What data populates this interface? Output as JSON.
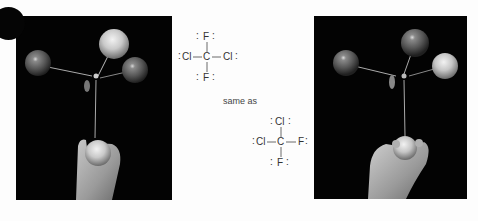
{
  "figure": {
    "left_photo": {
      "description": "molecular ball-and-stick model held in hand",
      "balls": [
        {
          "role": "left",
          "shade": "dark"
        },
        {
          "role": "top",
          "shade": "light"
        },
        {
          "role": "right",
          "shade": "dark"
        },
        {
          "role": "bottom-in-hand",
          "shade": "light"
        }
      ]
    },
    "right_photo": {
      "description": "rotated molecular ball-and-stick model held in hand",
      "balls": [
        {
          "role": "left",
          "shade": "dark"
        },
        {
          "role": "top",
          "shade": "dark"
        },
        {
          "role": "right",
          "shade": "light"
        },
        {
          "role": "bottom-in-hand",
          "shade": "light"
        }
      ]
    },
    "structure_top": {
      "center": "C",
      "top": "F",
      "left": "Cl",
      "right": "Cl",
      "bottom": "F"
    },
    "connector_text": "same as",
    "structure_bottom": {
      "center": "C",
      "top": "Cl",
      "left": "Cl",
      "right": "F",
      "bottom": "F"
    }
  }
}
